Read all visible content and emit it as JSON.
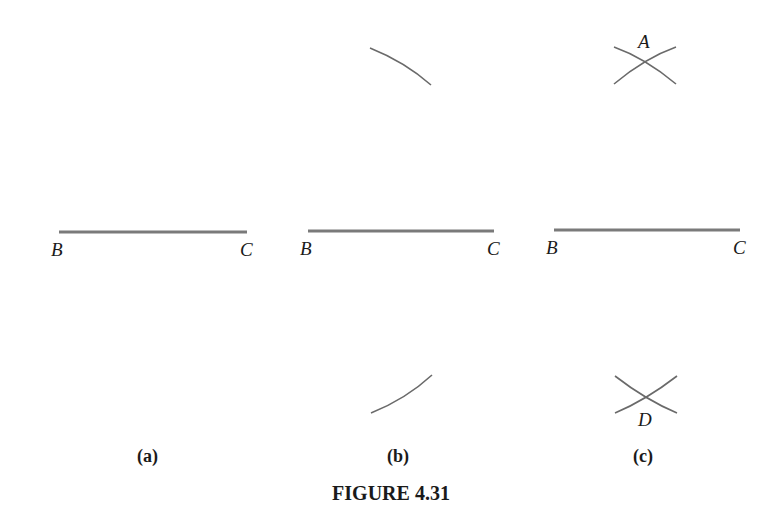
{
  "figure": {
    "caption": "FIGURE 4.31",
    "panels": [
      {
        "id": "a",
        "sub_label": "(a)",
        "segment": {
          "start_label": "B",
          "end_label": "C"
        },
        "arcs": []
      },
      {
        "id": "b",
        "sub_label": "(b)",
        "segment": {
          "start_label": "B",
          "end_label": "C"
        },
        "arcs": [
          "upper-arc",
          "lower-arc"
        ]
      },
      {
        "id": "c",
        "sub_label": "(c)",
        "segment": {
          "start_label": "B",
          "end_label": "C"
        },
        "intersections": {
          "upper_label": "A",
          "lower_label": "D"
        }
      }
    ],
    "colors": {
      "segment": "#7a7a7a",
      "arc": "#6a6a6a",
      "text": "#1a1a1a",
      "background": "#ffffff"
    }
  }
}
